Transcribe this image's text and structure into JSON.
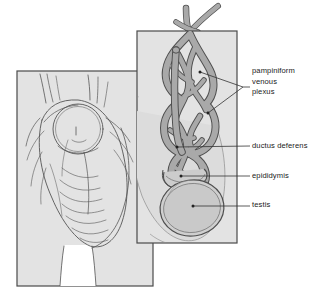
{
  "figure": {
    "panels": [
      {
        "name": "external-view",
        "description": "Line drawing of scrotum and groin, external view"
      },
      {
        "name": "internal-inset",
        "description": "Cutaway inset showing spermatic cord contents"
      }
    ],
    "labels": [
      {
        "id": "pampiniform",
        "lines": [
          "pampiniform",
          "venous",
          "plexus"
        ],
        "text": "pampiniform venous plexus"
      },
      {
        "id": "ductus",
        "lines": [
          "ductus deferens"
        ],
        "text": "ductus deferens"
      },
      {
        "id": "epididymis",
        "lines": [
          "epididymis"
        ],
        "text": "epididymis"
      },
      {
        "id": "testis",
        "lines": [
          "testis"
        ],
        "text": "testis"
      }
    ],
    "colors": {
      "panel_fill": "#e3e3e3",
      "panel_border": "#4a4a4a",
      "vessel_fill": "#a9a9a9",
      "vessel_stroke": "#4f4f4f",
      "organ_fill": "#c9c9c9",
      "line_art": "#555555",
      "label_text": "#1a1a1a",
      "leader_line": "#333333",
      "background": "#ffffff"
    }
  }
}
